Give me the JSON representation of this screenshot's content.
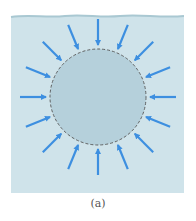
{
  "figure": {
    "caption": "(a)",
    "colors": {
      "background": "#cfe3ea",
      "sphere_fill": "#b5d0db",
      "sphere_outline": "#555555",
      "arrow": "#3d8fe0",
      "water_surface": "#a9c8d2"
    },
    "sphere": {
      "cx": 98,
      "cy": 97,
      "r": 48,
      "outline_style": "dashed"
    },
    "arrows": {
      "count": 16,
      "direction": "inward",
      "description": "pressure arrows pointing radially toward the sphere from all directions"
    }
  }
}
